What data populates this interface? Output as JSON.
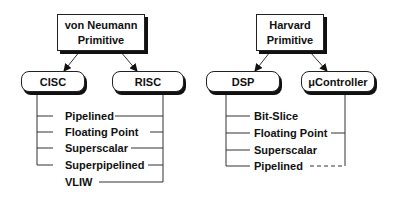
{
  "diagram": {
    "trees": [
      {
        "root": {
          "line1": "von Neumann",
          "line2": "Primitive"
        },
        "classes": [
          {
            "label": "CISC"
          },
          {
            "label": "RISC"
          }
        ],
        "variants": [
          {
            "label": "Pipelined",
            "left": true,
            "right": true,
            "right_style": "solid"
          },
          {
            "label": "Floating Point",
            "left": true,
            "right": true,
            "right_style": "solid"
          },
          {
            "label": "Superscalar",
            "left": true,
            "right": true,
            "right_style": "solid"
          },
          {
            "label": "Superpipelined",
            "left": true,
            "right": true,
            "right_style": "solid"
          },
          {
            "label": "VLIW",
            "left": false,
            "right": true,
            "right_style": "solid"
          }
        ]
      },
      {
        "root": {
          "line1": "Harvard",
          "line2": "Primitive"
        },
        "classes": [
          {
            "label": "DSP"
          },
          {
            "label": "μController"
          }
        ],
        "variants": [
          {
            "label": "Bit-Slice",
            "left": true,
            "right": false,
            "right_style": "none"
          },
          {
            "label": "Floating Point",
            "left": true,
            "right": true,
            "right_style": "solid"
          },
          {
            "label": "Superscalar",
            "left": true,
            "right": false,
            "right_style": "none"
          },
          {
            "label": "Pipelined",
            "left": true,
            "right": true,
            "right_style": "dashed"
          }
        ]
      }
    ]
  }
}
